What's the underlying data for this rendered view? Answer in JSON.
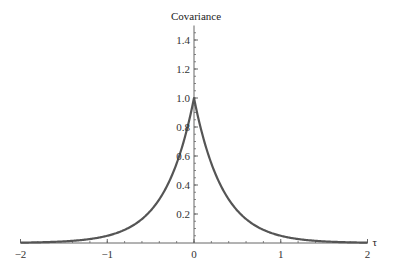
{
  "chart_data": {
    "type": "line",
    "title": "",
    "xlabel": "τ",
    "ylabel": "Covariance",
    "xlim": [
      -2,
      2
    ],
    "ylim": [
      0,
      1.5
    ],
    "grid": false,
    "legend": null,
    "x_ticks": [
      {
        "value": -2,
        "label": "−2"
      },
      {
        "value": -1,
        "label": "−1"
      },
      {
        "value": 0,
        "label": "0"
      },
      {
        "value": 1,
        "label": "1"
      },
      {
        "value": 2,
        "label": "2"
      }
    ],
    "y_ticks": [
      {
        "value": 0.2,
        "label": "0.2"
      },
      {
        "value": 0.4,
        "label": "0.4"
      },
      {
        "value": 0.6,
        "label": "0.6"
      },
      {
        "value": 0.8,
        "label": "0.8"
      },
      {
        "value": 1.0,
        "label": "1.0"
      },
      {
        "value": 1.2,
        "label": "1.2"
      },
      {
        "value": 1.4,
        "label": "1.4"
      }
    ],
    "series": [
      {
        "name": "Covariance",
        "function": "exp(-3|τ|)",
        "color": "#555555",
        "x": [
          -2,
          -1.5,
          -1,
          -0.75,
          -0.5,
          -0.25,
          -0.1,
          0,
          0.1,
          0.25,
          0.5,
          0.75,
          1,
          1.5,
          2
        ],
        "y": [
          0.0025,
          0.011,
          0.05,
          0.105,
          0.223,
          0.472,
          0.741,
          1.0,
          0.741,
          0.472,
          0.223,
          0.105,
          0.05,
          0.011,
          0.0025
        ]
      }
    ]
  },
  "colors": {
    "curve": "#555555",
    "axis": "#666666",
    "background": "#ffffff"
  }
}
